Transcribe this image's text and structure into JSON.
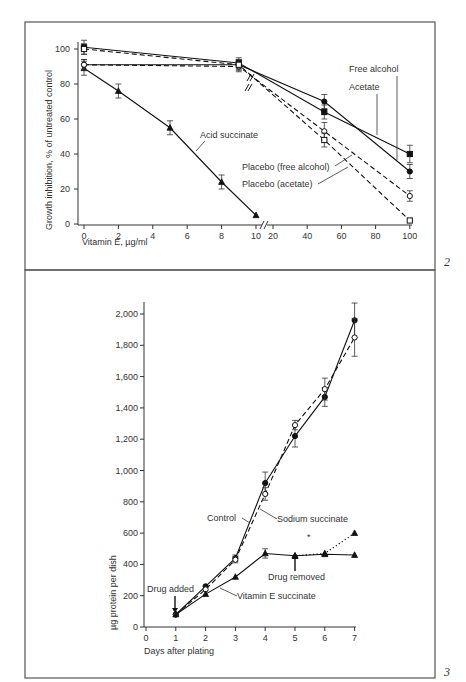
{
  "figure": {
    "panel_numbers": [
      "2",
      "3"
    ]
  },
  "chart_data": [
    {
      "type": "line",
      "panel": "2",
      "title": "",
      "xlabel": "Vitamin E, µg/ml",
      "ylabel": "Growth inhibition, % of untreated control",
      "x_ticks": [
        "0",
        "2",
        "4",
        "6",
        "8",
        "10",
        "20",
        "40",
        "60",
        "80",
        "100"
      ],
      "y_ticks": [
        "0",
        "20",
        "40",
        "60",
        "80",
        "100"
      ],
      "ylim": [
        0,
        105
      ],
      "x_axis_break": "between 10 and 20",
      "grid": false,
      "series": [
        {
          "name": "Acid succinate",
          "marker": "filled-triangle",
          "line": "solid",
          "x": [
            0,
            2,
            5,
            8,
            10
          ],
          "y": [
            89,
            76,
            55,
            24,
            5
          ],
          "err": [
            4,
            4,
            4,
            4,
            0
          ]
        },
        {
          "name": "Free alcohol",
          "marker": "filled-circle",
          "line": "solid",
          "x": [
            0,
            9,
            50,
            100
          ],
          "y": [
            91,
            91,
            70,
            30
          ],
          "err": [
            3,
            3,
            4,
            4
          ]
        },
        {
          "name": "Acetate",
          "marker": "filled-square",
          "line": "solid",
          "x": [
            0,
            9,
            50,
            100
          ],
          "y": [
            101,
            92,
            64,
            40
          ],
          "err": [
            4,
            3,
            4,
            5
          ]
        },
        {
          "name": "Placebo (free alcohol)",
          "marker": "open-circle",
          "line": "dashed",
          "x": [
            0,
            9,
            50,
            100
          ],
          "y": [
            91,
            90,
            53,
            16
          ],
          "err": [
            3,
            3,
            5,
            3
          ]
        },
        {
          "name": "Placebo (acetate)",
          "marker": "open-square",
          "line": "dashed",
          "x": [
            0,
            9,
            50,
            100
          ],
          "y": [
            100,
            91,
            48,
            2
          ],
          "err": [
            3,
            3,
            4,
            0
          ]
        }
      ],
      "annotations": [
        "Acid succinate",
        "Free alcohol",
        "Acetate",
        "Placebo (free alcohol)",
        "Placebo (acetate)"
      ]
    },
    {
      "type": "line",
      "panel": "3",
      "title": "",
      "xlabel": "Days after plating",
      "ylabel": "µg protein per dish",
      "x_ticks": [
        "0",
        "1",
        "2",
        "3",
        "4",
        "5",
        "6",
        "7"
      ],
      "y_ticks": [
        "0",
        "200",
        "400",
        "600",
        "800",
        "1,000",
        "1,200",
        "1,400",
        "1,600",
        "1,800",
        "2,000"
      ],
      "xlim": [
        0,
        7
      ],
      "ylim": [
        0,
        2080
      ],
      "grid": false,
      "series": [
        {
          "name": "Control",
          "marker": "filled-circle",
          "line": "solid",
          "x": [
            1,
            2,
            3,
            4,
            5,
            6,
            7
          ],
          "y": [
            80,
            260,
            440,
            920,
            1220,
            1470,
            1960
          ],
          "err": [
            0,
            0,
            20,
            70,
            70,
            60,
            110
          ]
        },
        {
          "name": "Sodium succinate",
          "marker": "open-circle",
          "line": "dashed",
          "x": [
            1,
            2,
            3,
            4,
            5,
            6,
            7
          ],
          "y": [
            80,
            240,
            430,
            850,
            1290,
            1520,
            1850
          ],
          "err": [
            0,
            0,
            20,
            40,
            30,
            70,
            120
          ]
        },
        {
          "name": "Vitamin E succinate",
          "marker": "filled-triangle",
          "line": "solid",
          "x": [
            1,
            2,
            3,
            4,
            5,
            6,
            7
          ],
          "y": [
            80,
            210,
            320,
            470,
            455,
            465,
            460
          ],
          "err": [
            0,
            0,
            0,
            30,
            0,
            0,
            0
          ]
        },
        {
          "name": "Vitamin E succinate (drug removed)",
          "marker": "filled-triangle",
          "line": "dotted",
          "x": [
            5,
            6,
            7
          ],
          "y": [
            455,
            470,
            600
          ],
          "err": [
            0,
            0,
            0
          ]
        }
      ],
      "annotations": [
        "Drug added",
        "Drug removed",
        "Control",
        "Sodium succinate",
        "Vitamin E succinate",
        "*"
      ]
    }
  ]
}
